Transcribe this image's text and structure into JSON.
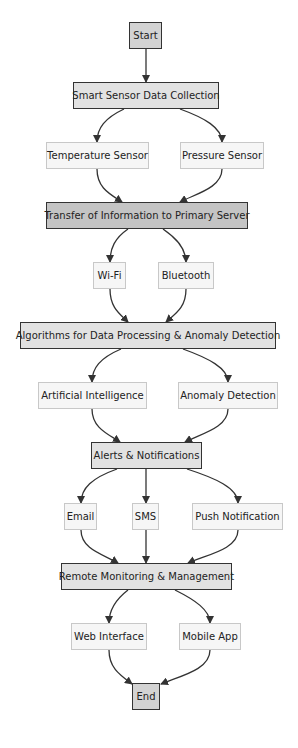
{
  "diagram": {
    "type": "flowchart",
    "colors": {
      "terminal_fill": "#d3d3d3",
      "main_fill": "#e2e2e2",
      "main_dark_fill": "#c4c4c4",
      "leaf_fill": "#f6f6f6",
      "leaf_border": "#c8c8c8",
      "edge": "#333333"
    },
    "nodes": {
      "start": "Start",
      "smart_sensor": "Smart Sensor Data Collection",
      "temperature": "Temperature Sensor",
      "pressure": "Pressure Sensor",
      "transfer": "Transfer of Information to Primary Server",
      "wifi": "Wi-Fi",
      "bluetooth": "Bluetooth",
      "algorithms": "Algorithms for Data Processing & Anomaly Detection",
      "ai": "Artificial Intelligence",
      "anomaly": "Anomaly Detection",
      "alerts": "Alerts & Notifications",
      "email": "Email",
      "sms": "SMS",
      "push": "Push Notification",
      "remote": "Remote Monitoring & Management",
      "web": "Web Interface",
      "mobile": "Mobile App",
      "end": "End"
    },
    "edges": [
      [
        "start",
        "smart_sensor"
      ],
      [
        "smart_sensor",
        "temperature"
      ],
      [
        "smart_sensor",
        "pressure"
      ],
      [
        "temperature",
        "transfer"
      ],
      [
        "pressure",
        "transfer"
      ],
      [
        "transfer",
        "wifi"
      ],
      [
        "transfer",
        "bluetooth"
      ],
      [
        "wifi",
        "algorithms"
      ],
      [
        "bluetooth",
        "algorithms"
      ],
      [
        "algorithms",
        "ai"
      ],
      [
        "algorithms",
        "anomaly"
      ],
      [
        "ai",
        "alerts"
      ],
      [
        "anomaly",
        "alerts"
      ],
      [
        "alerts",
        "email"
      ],
      [
        "alerts",
        "sms"
      ],
      [
        "alerts",
        "push"
      ],
      [
        "email",
        "remote"
      ],
      [
        "sms",
        "remote"
      ],
      [
        "push",
        "remote"
      ],
      [
        "remote",
        "web"
      ],
      [
        "remote",
        "mobile"
      ],
      [
        "web",
        "end"
      ],
      [
        "mobile",
        "end"
      ]
    ]
  }
}
